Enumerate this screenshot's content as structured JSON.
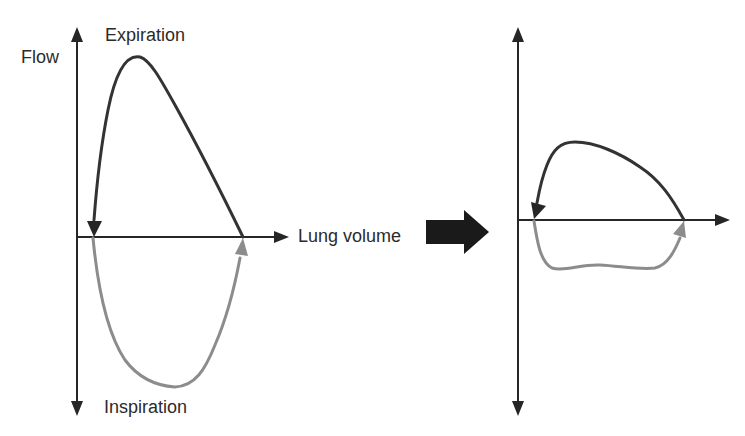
{
  "labels": {
    "y_axis": "Flow",
    "upper": "Expiration",
    "lower": "Inspiration",
    "x_axis": "Lung volume"
  },
  "colors": {
    "axis": "#262626",
    "expiration_curve": "#333333",
    "inspiration_curve": "#8c8c8c",
    "transition_arrow": "#1a1a1a"
  },
  "panels": [
    {
      "name": "normal-flow-volume-loop",
      "description": "Tall expiratory peak, deep inspiratory trough"
    },
    {
      "name": "restricted-flow-volume-loop",
      "description": "Flattened expiratory and inspiratory limbs"
    }
  ]
}
